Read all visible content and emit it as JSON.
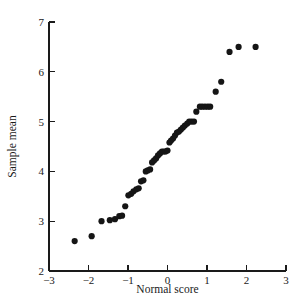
{
  "chart_data": {
    "type": "scatter",
    "title": "",
    "subtitle": "",
    "xlabel": "Normal score",
    "ylabel": "Sample mean",
    "xlim": [
      -3,
      3
    ],
    "ylim": [
      2,
      7
    ],
    "xticks": [
      -3,
      -2,
      -1,
      0,
      1,
      2,
      3
    ],
    "xticklabels": [
      "-3",
      "-2",
      "-1",
      "0",
      "1",
      "2",
      "3"
    ],
    "yticks": [
      2,
      3,
      4,
      5,
      6,
      7
    ],
    "yticklabels": [
      "2",
      "3",
      "4",
      "5",
      "6",
      "7"
    ],
    "grid": false,
    "legend": null,
    "marker": "filled-circle",
    "marker_color": "#151515",
    "marker_size": 3.1,
    "annotations": [],
    "points": [
      {
        "x": -2.35,
        "y": 2.6
      },
      {
        "x": -1.92,
        "y": 2.7
      },
      {
        "x": -1.67,
        "y": 3.0
      },
      {
        "x": -1.46,
        "y": 3.02
      },
      {
        "x": -1.33,
        "y": 3.04
      },
      {
        "x": -1.22,
        "y": 3.1
      },
      {
        "x": -1.15,
        "y": 3.11
      },
      {
        "x": -1.07,
        "y": 3.3
      },
      {
        "x": -0.99,
        "y": 3.52
      },
      {
        "x": -0.92,
        "y": 3.55
      },
      {
        "x": -0.86,
        "y": 3.6
      },
      {
        "x": -0.79,
        "y": 3.64
      },
      {
        "x": -0.73,
        "y": 3.66
      },
      {
        "x": -0.67,
        "y": 3.8
      },
      {
        "x": -0.61,
        "y": 3.82
      },
      {
        "x": -0.55,
        "y": 4.0
      },
      {
        "x": -0.5,
        "y": 4.02
      },
      {
        "x": -0.44,
        "y": 4.04
      },
      {
        "x": -0.39,
        "y": 4.18
      },
      {
        "x": -0.34,
        "y": 4.22
      },
      {
        "x": -0.29,
        "y": 4.26
      },
      {
        "x": -0.24,
        "y": 4.32
      },
      {
        "x": -0.19,
        "y": 4.36
      },
      {
        "x": -0.14,
        "y": 4.4
      },
      {
        "x": -0.09,
        "y": 4.4
      },
      {
        "x": -0.05,
        "y": 4.4
      },
      {
        "x": 0.0,
        "y": 4.42
      },
      {
        "x": 0.05,
        "y": 4.58
      },
      {
        "x": 0.09,
        "y": 4.62
      },
      {
        "x": 0.14,
        "y": 4.66
      },
      {
        "x": 0.19,
        "y": 4.72
      },
      {
        "x": 0.24,
        "y": 4.78
      },
      {
        "x": 0.29,
        "y": 4.8
      },
      {
        "x": 0.34,
        "y": 4.84
      },
      {
        "x": 0.39,
        "y": 4.88
      },
      {
        "x": 0.44,
        "y": 4.92
      },
      {
        "x": 0.5,
        "y": 4.96
      },
      {
        "x": 0.55,
        "y": 5.0
      },
      {
        "x": 0.61,
        "y": 5.0
      },
      {
        "x": 0.67,
        "y": 5.0
      },
      {
        "x": 0.73,
        "y": 5.2
      },
      {
        "x": 0.82,
        "y": 5.3
      },
      {
        "x": 0.88,
        "y": 5.3
      },
      {
        "x": 0.95,
        "y": 5.3
      },
      {
        "x": 1.02,
        "y": 5.3
      },
      {
        "x": 1.08,
        "y": 5.3
      },
      {
        "x": 1.22,
        "y": 5.6
      },
      {
        "x": 1.36,
        "y": 5.8
      },
      {
        "x": 1.57,
        "y": 6.4
      },
      {
        "x": 1.8,
        "y": 6.5
      },
      {
        "x": 2.23,
        "y": 6.5
      }
    ]
  }
}
